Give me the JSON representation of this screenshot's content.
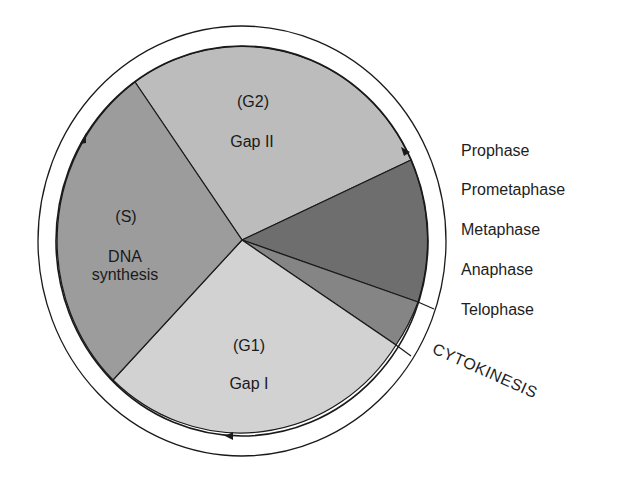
{
  "diagram": {
    "colors": {
      "g1": "#d2d2d2",
      "s": "#9c9c9c",
      "g2": "#bcbcbc",
      "mitosis": "#6e6e6e",
      "telophase": "#858585",
      "outline": "#1a1a1a",
      "background": "#ffffff"
    },
    "sectors": [
      {
        "id": "g2",
        "code": "(G2)",
        "name": "Gap II"
      },
      {
        "id": "s",
        "code": "(S)",
        "name_line1": "DNA",
        "name_line2": "synthesis"
      },
      {
        "id": "g1",
        "code": "(G1)",
        "name": "Gap I"
      },
      {
        "id": "mitosis",
        "name": "Prophase–Anaphase"
      },
      {
        "id": "telophase",
        "name": "Telophase"
      }
    ],
    "mitosis_labels": [
      "Prophase",
      "Prometaphase",
      "Metaphase",
      "Anaphase",
      "Telophase"
    ],
    "cytokinesis_label": "CYTOKINESIS",
    "arrows": [
      "arrow-up-left-side",
      "arrow-down-right-side",
      "arrow-left-bottom"
    ]
  }
}
